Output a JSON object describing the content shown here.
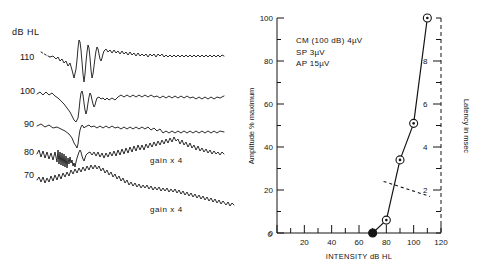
{
  "figure": {
    "title": "",
    "background": "#ffffff",
    "ink_color": "#141414"
  },
  "left_panel": {
    "name": "electrocochleography-waveform-stack",
    "axis_title": "dB HL",
    "intensity_labels": [
      "110",
      "100",
      "90",
      "80",
      "70"
    ],
    "annotations": [
      {
        "label": "gain x 4",
        "trace": "80"
      },
      {
        "label": "gain x 4",
        "trace": "70"
      }
    ]
  },
  "chart_data": {
    "type": "line",
    "title": "",
    "xlabel": "INTENSITY dB HL",
    "ylabel": "Amplitude % maximum",
    "y2label": "Latency in msec",
    "xlim": [
      0,
      120
    ],
    "ylim": [
      0,
      100
    ],
    "y2lim": [
      0,
      10
    ],
    "grid": false,
    "legend": null,
    "x_ticks": [
      0,
      20,
      40,
      60,
      80,
      100,
      120
    ],
    "x_tick_labels": [
      "0",
      "20",
      "40",
      "60",
      "80",
      "100",
      "120"
    ],
    "x_minor_step": 10,
    "y_ticks": [
      0,
      20,
      40,
      60,
      80,
      100
    ],
    "y_tick_labels": [
      "0",
      "20",
      "40",
      "60",
      "80",
      "100"
    ],
    "y_minor_step": 10,
    "y2_ticks": [
      2,
      4,
      6,
      8
    ],
    "y2_tick_labels": [
      "2",
      "4",
      "6",
      "8"
    ],
    "y2_minor_step": 1,
    "series": [
      {
        "name": "Amplitude % maximum",
        "marker": "circle-dot",
        "x": [
          70,
          80,
          90,
          100,
          110
        ],
        "values": [
          0,
          6,
          34,
          51,
          100
        ]
      },
      {
        "name": "Latency in msec",
        "marker": "none",
        "style": "dashed",
        "x": [
          78,
          112
        ],
        "values": [
          2.4,
          1.7
        ]
      }
    ],
    "annotations": [
      {
        "text": "CM (100 dB)   4µV"
      },
      {
        "text": "SP    3µV"
      },
      {
        "text": "AP    15µV"
      }
    ]
  }
}
